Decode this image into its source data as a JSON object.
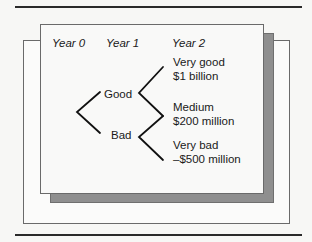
{
  "figure": {
    "type": "decision-tree",
    "columns": [
      "Year 0",
      "Year 1",
      "Year 2"
    ],
    "year1_nodes": [
      {
        "label": "Good"
      },
      {
        "label": "Bad"
      }
    ],
    "year2_outcomes": [
      {
        "label": "Very good",
        "value": "$1 billion"
      },
      {
        "label": "Medium",
        "value": "$200 million"
      },
      {
        "label": "Very bad",
        "value": "–$500 million"
      }
    ],
    "colors": {
      "shadow": "#8f8f8f",
      "card": "#f9f9f8",
      "line": "#111111"
    }
  }
}
